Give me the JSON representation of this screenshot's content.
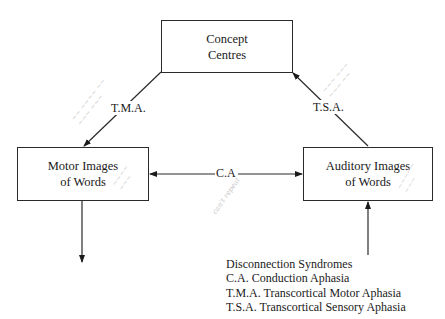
{
  "diagram": {
    "nodes": {
      "concept": {
        "line1": "Concept",
        "line2": "Centres"
      },
      "motor": {
        "line1": "Motor Images",
        "line2": "of Words"
      },
      "auditory": {
        "line1": "Auditory Images",
        "line2": "of Words"
      }
    },
    "edges": [
      {
        "from": "concept",
        "to": "motor",
        "label": "T.M.A."
      },
      {
        "from": "auditory",
        "to": "concept",
        "label": "T.S.A."
      },
      {
        "from": "auditory",
        "to": "motor",
        "label": "C.A",
        "bidirectional": true
      },
      {
        "from": "motor",
        "to": "output",
        "label": ""
      },
      {
        "from": "input",
        "to": "auditory",
        "label": ""
      }
    ],
    "labels": {
      "tma": "T.M.A.",
      "tsa": "T.S.A.",
      "ca": "C.A"
    },
    "legend": {
      "title": "Disconnection Syndromes",
      "items": [
        "C.A. Conduction Aphasia",
        "T.M.A. Transcortical Motor Aphasia",
        "T.S.A. Transcortical Sensory Aphasia"
      ]
    },
    "annotations": {
      "note_tma": "illegible pencil note",
      "note_tsa": "illegible pencil note",
      "note_motor": "illegible pencil note",
      "note_auditory": "illegible pencil note",
      "note_ca": "can't repeat"
    },
    "colors": {
      "line": "#2a2a2a",
      "pencil": "#c8c8c8",
      "background": "#ffffff"
    }
  }
}
